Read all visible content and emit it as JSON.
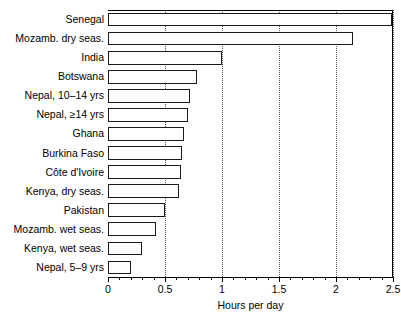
{
  "chart_data": {
    "type": "bar",
    "orientation": "horizontal",
    "title": "",
    "xlabel": "Hours per day",
    "ylabel": "",
    "xlim": [
      0,
      2.5
    ],
    "grid": "vertical-dotted",
    "legend": "none",
    "categories": [
      "Senegal",
      "Mozamb. dry seas.",
      "India",
      "Botswana",
      "Nepal, 10–14 yrs",
      "Nepal, ≥14 yrs",
      "Ghana",
      "Burkina Faso",
      "Côte d'Ivoire",
      "Kenya, dry seas.",
      "Pakistan",
      "Mozamb. wet seas.",
      "Kenya, wet seas.",
      "Nepal, 5–9 yrs"
    ],
    "values": [
      2.49,
      2.15,
      1.0,
      0.78,
      0.72,
      0.7,
      0.67,
      0.65,
      0.64,
      0.62,
      0.5,
      0.42,
      0.3,
      0.2
    ],
    "xticks": [
      0,
      0.5,
      1,
      1.5,
      2,
      2.5
    ],
    "xtick_labels": [
      "0",
      "0.5",
      "1",
      "1.5",
      "2",
      "2.5"
    ],
    "minor_tick_step": 0.1,
    "bar_fill_color": "#ffffff",
    "bar_edge_color": "#1a1a1a",
    "gridline_color": "#555555",
    "axis_color": "#000000"
  }
}
